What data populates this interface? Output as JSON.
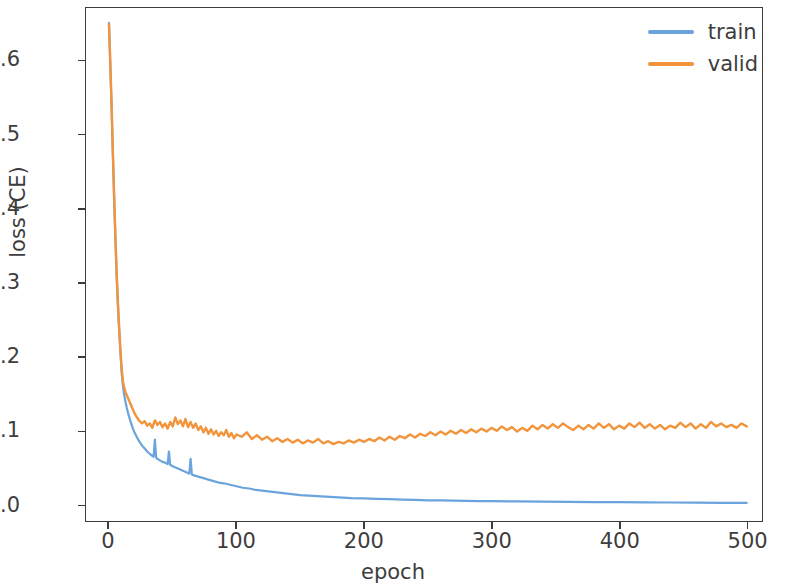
{
  "chart_data": {
    "type": "line",
    "title": "",
    "xlabel": "epoch",
    "ylabel": "loss (CE)",
    "xlim": [
      -18,
      512
    ],
    "ylim": [
      -0.022,
      0.672
    ],
    "xticks": [
      0,
      100,
      200,
      300,
      400,
      500
    ],
    "xtick_labels": [
      "0",
      "100",
      "200",
      "300",
      "400",
      "500"
    ],
    "yticks": [
      0.0,
      0.1,
      0.2,
      0.3,
      0.4,
      0.5,
      0.6
    ],
    "ytick_labels": [
      "0.0",
      "0.1",
      "0.2",
      "0.3",
      "0.4",
      "0.5",
      "0.6"
    ],
    "grid": false,
    "legend_position": "upper right",
    "colors": {
      "train": "#6BA4DC",
      "valid": "#F1943B",
      "axis": "#3c3c3c",
      "text": "#3d3d3d",
      "background": "#ffffff"
    },
    "series": [
      {
        "name": "train",
        "color": "#6BA4DC",
        "x": [
          0,
          1,
          2,
          3,
          4,
          5,
          6,
          7,
          8,
          9,
          10,
          11,
          12,
          13,
          14,
          15,
          16,
          17,
          18,
          19,
          20,
          22,
          24,
          26,
          28,
          30,
          32,
          34,
          35,
          36,
          37,
          38,
          40,
          42,
          44,
          46,
          47,
          48,
          49,
          50,
          54,
          58,
          62,
          63,
          64,
          65,
          66,
          70,
          74,
          78,
          82,
          86,
          90,
          95,
          100,
          105,
          110,
          115,
          120,
          130,
          140,
          150,
          160,
          170,
          180,
          190,
          200,
          210,
          220,
          230,
          240,
          250,
          260,
          270,
          280,
          290,
          300,
          320,
          340,
          360,
          380,
          400,
          420,
          440,
          460,
          480,
          500
        ],
        "y": [
          0.652,
          0.598,
          0.54,
          0.478,
          0.418,
          0.362,
          0.312,
          0.27,
          0.236,
          0.205,
          0.178,
          0.16,
          0.148,
          0.139,
          0.131,
          0.124,
          0.118,
          0.112,
          0.107,
          0.102,
          0.098,
          0.091,
          0.085,
          0.08,
          0.076,
          0.072,
          0.069,
          0.066,
          0.065,
          0.088,
          0.064,
          0.062,
          0.06,
          0.058,
          0.057,
          0.055,
          0.072,
          0.054,
          0.053,
          0.052,
          0.049,
          0.046,
          0.043,
          0.042,
          0.062,
          0.041,
          0.04,
          0.038,
          0.036,
          0.034,
          0.032,
          0.03,
          0.029,
          0.027,
          0.025,
          0.023,
          0.022,
          0.02,
          0.019,
          0.017,
          0.015,
          0.013,
          0.012,
          0.011,
          0.01,
          0.009,
          0.0085,
          0.008,
          0.0075,
          0.007,
          0.0065,
          0.006,
          0.0058,
          0.0055,
          0.0052,
          0.005,
          0.0048,
          0.0045,
          0.0042,
          0.0039,
          0.0036,
          0.0034,
          0.0032,
          0.003,
          0.0028,
          0.0026,
          0.0025
        ]
      },
      {
        "name": "valid",
        "color": "#F1943B",
        "x": [
          0,
          1,
          2,
          3,
          4,
          5,
          6,
          7,
          8,
          9,
          10,
          11,
          12,
          13,
          14,
          15,
          16,
          17,
          18,
          19,
          20,
          22,
          24,
          26,
          28,
          30,
          32,
          34,
          36,
          38,
          40,
          42,
          44,
          46,
          48,
          50,
          52,
          54,
          56,
          58,
          60,
          62,
          64,
          66,
          68,
          70,
          72,
          74,
          76,
          78,
          80,
          82,
          84,
          86,
          88,
          90,
          92,
          94,
          96,
          98,
          100,
          104,
          108,
          112,
          116,
          120,
          124,
          128,
          132,
          136,
          140,
          144,
          148,
          152,
          156,
          160,
          164,
          168,
          172,
          176,
          180,
          184,
          188,
          192,
          196,
          200,
          204,
          208,
          212,
          216,
          220,
          224,
          228,
          232,
          236,
          240,
          244,
          248,
          252,
          256,
          260,
          264,
          268,
          272,
          276,
          280,
          284,
          288,
          292,
          296,
          300,
          304,
          308,
          312,
          316,
          320,
          324,
          328,
          332,
          336,
          340,
          344,
          348,
          352,
          356,
          360,
          364,
          368,
          372,
          376,
          380,
          384,
          388,
          392,
          396,
          400,
          404,
          408,
          412,
          416,
          420,
          424,
          428,
          432,
          436,
          440,
          444,
          448,
          452,
          456,
          460,
          464,
          468,
          472,
          476,
          480,
          484,
          488,
          492,
          496,
          500
        ],
        "y": [
          0.65,
          0.6,
          0.545,
          0.482,
          0.422,
          0.366,
          0.316,
          0.274,
          0.24,
          0.21,
          0.184,
          0.166,
          0.158,
          0.152,
          0.148,
          0.144,
          0.14,
          0.136,
          0.132,
          0.128,
          0.124,
          0.118,
          0.113,
          0.11,
          0.113,
          0.107,
          0.11,
          0.104,
          0.114,
          0.108,
          0.112,
          0.105,
          0.11,
          0.103,
          0.112,
          0.106,
          0.118,
          0.109,
          0.114,
          0.106,
          0.116,
          0.105,
          0.112,
          0.104,
          0.11,
          0.101,
          0.106,
          0.098,
          0.104,
          0.096,
          0.102,
          0.095,
          0.1,
          0.093,
          0.098,
          0.094,
          0.101,
          0.092,
          0.097,
          0.09,
          0.095,
          0.092,
          0.098,
          0.089,
          0.094,
          0.088,
          0.092,
          0.086,
          0.09,
          0.085,
          0.089,
          0.084,
          0.088,
          0.083,
          0.087,
          0.084,
          0.089,
          0.083,
          0.086,
          0.082,
          0.085,
          0.083,
          0.087,
          0.084,
          0.088,
          0.085,
          0.089,
          0.086,
          0.091,
          0.087,
          0.092,
          0.088,
          0.093,
          0.09,
          0.095,
          0.091,
          0.096,
          0.093,
          0.098,
          0.094,
          0.099,
          0.095,
          0.1,
          0.096,
          0.101,
          0.097,
          0.102,
          0.098,
          0.103,
          0.099,
          0.104,
          0.1,
          0.106,
          0.101,
          0.105,
          0.099,
          0.104,
          0.1,
          0.107,
          0.102,
          0.108,
          0.103,
          0.109,
          0.104,
          0.11,
          0.105,
          0.101,
          0.107,
          0.102,
          0.108,
          0.103,
          0.11,
          0.104,
          0.109,
          0.102,
          0.107,
          0.103,
          0.11,
          0.105,
          0.111,
          0.104,
          0.109,
          0.103,
          0.108,
          0.102,
          0.107,
          0.104,
          0.111,
          0.105,
          0.11,
          0.103,
          0.109,
          0.104,
          0.112,
          0.106,
          0.11,
          0.105,
          0.108,
          0.104,
          0.11,
          0.106
        ]
      }
    ],
    "legend": [
      {
        "label": "train",
        "color": "#6BA4DC"
      },
      {
        "label": "valid",
        "color": "#F1943B"
      }
    ]
  }
}
